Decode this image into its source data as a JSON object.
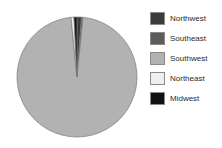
{
  "chart_data": {
    "type": "pie",
    "title": "",
    "categories": [
      "Northwest",
      "Southeast",
      "Southwest",
      "Northeast",
      "Midwest"
    ],
    "values": [
      1.2,
      0.4,
      96.8,
      0.8,
      0.8
    ],
    "colors": [
      "#3b3b3b",
      "#5c5c5c",
      "#b2b2b2",
      "#efefef",
      "#111111"
    ],
    "legend_position": "right",
    "grid": false,
    "start_angle_deg": 0,
    "direction": "clockwise",
    "stroke": "#7a7a7a"
  },
  "legend": {
    "items": [
      {
        "label": "Northwest",
        "color": "#3b3b3b"
      },
      {
        "label": "Southeast",
        "color": "#5c5c5c"
      },
      {
        "label": "Southwest",
        "color": "#b2b2b2"
      },
      {
        "label": "Northeast",
        "color": "#efefef"
      },
      {
        "label": "Midwest",
        "color": "#111111"
      }
    ]
  }
}
